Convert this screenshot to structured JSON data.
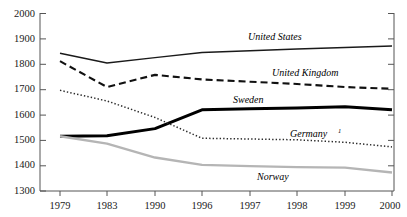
{
  "chart_data": {
    "type": "line",
    "title": "",
    "subtitle": "",
    "xlabel": "",
    "ylabel": "",
    "categories": [
      "1979",
      "1983",
      "1990",
      "1996",
      "1997",
      "1998",
      "1999",
      "2000"
    ],
    "x": [
      1979,
      1983,
      1990,
      1996,
      1997,
      1998,
      1999,
      2000
    ],
    "ylim": [
      1300,
      2000
    ],
    "yticks": [
      1300,
      1400,
      1500,
      1600,
      1700,
      1800,
      1900,
      2000
    ],
    "ytick_labels": [
      "1300",
      "1400",
      "1500",
      "1600",
      "1700",
      "1800",
      "1900",
      "2000"
    ],
    "grid": false,
    "legend": "inline-labels",
    "series": [
      {
        "name": "United States",
        "label": "United States",
        "style": "solid",
        "color": "#1a1a1a",
        "width": 1.4,
        "values": [
          1843,
          1805,
          1826,
          1846,
          1853,
          1860,
          1866,
          1872
        ]
      },
      {
        "name": "United Kingdom",
        "label": "United Kingdom",
        "style": "dashed",
        "color": "#111111",
        "width": 2.1,
        "values": [
          1812,
          1710,
          1758,
          1740,
          1731,
          1722,
          1710,
          1703
        ]
      },
      {
        "name": "Sweden",
        "label": "Sweden",
        "style": "solid-thick",
        "color": "#000000",
        "width": 3.0,
        "values": [
          1516,
          1518,
          1546,
          1620,
          1624,
          1627,
          1632,
          1620
        ]
      },
      {
        "name": "Germany",
        "label": "Germany",
        "label_superscript": "1",
        "style": "dotted",
        "color": "#2b2b2b",
        "width": 1.5,
        "values": [
          1697,
          1655,
          1590,
          1508,
          1505,
          1502,
          1492,
          1474
        ]
      },
      {
        "name": "Norway",
        "label": "Norway",
        "style": "solid-gray",
        "color": "#b5b5b5",
        "width": 2.4,
        "values": [
          1516,
          1487,
          1432,
          1403,
          1398,
          1394,
          1392,
          1373
        ]
      }
    ],
    "annotations": [
      {
        "text": "United States",
        "series": "United States"
      },
      {
        "text": "United Kingdom",
        "series": "United Kingdom"
      },
      {
        "text": "Sweden",
        "series": "Sweden"
      },
      {
        "text": "Germany",
        "series": "Germany",
        "superscript": "1"
      },
      {
        "text": "Norway",
        "series": "Norway"
      }
    ]
  },
  "axes": {
    "y_labels": [
      "2000",
      "1900",
      "1800",
      "1700",
      "1600",
      "1500",
      "1400",
      "1300"
    ],
    "x_labels": [
      "1979",
      "1983",
      "1990",
      "1996",
      "1997",
      "1998",
      "1999",
      "2000"
    ]
  },
  "labels": {
    "united_states": "United States",
    "united_kingdom": "United Kingdom",
    "sweden": "Sweden",
    "germany": "Germany",
    "germany_sup": "1",
    "norway": "Norway"
  },
  "ghost": {
    "cropped_title_fragment": ""
  }
}
